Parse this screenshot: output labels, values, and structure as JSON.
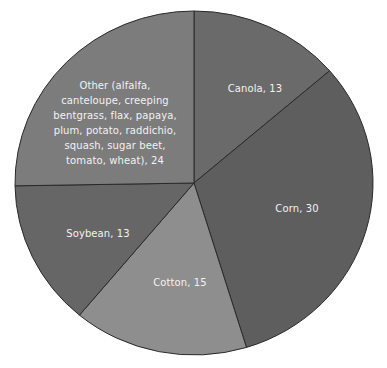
{
  "chart_data": {
    "type": "pie",
    "title": "",
    "xlabel": "",
    "ylabel": "",
    "legend": "none (data labels on slices)",
    "start_angle_deg": 0,
    "direction": "clockwise",
    "center": [
      194,
      183
    ],
    "radius": [
      179,
      172
    ],
    "categories": [
      "Canola",
      "Corn",
      "Cotton",
      "Soybean",
      "Other (alfalfa, canteloupe, creeping bentgrass, flax, papaya, plum, potato, raddichio, squash, sugar beet, tomato, wheat)"
    ],
    "values": [
      13,
      30,
      15,
      13,
      24
    ],
    "colors": [
      "#6a6a6a",
      "#5e5e5e",
      "#8e8e8e",
      "#666666",
      "#7c7c7c"
    ],
    "labels": [
      {
        "text": "Canola, 13",
        "x": 255,
        "y": 88
      },
      {
        "text": "Corn, 30",
        "x": 297,
        "y": 208
      },
      {
        "text": "Cotton, 15",
        "x": 180,
        "y": 282
      },
      {
        "text": "Soybean, 13",
        "x": 98,
        "y": 233
      },
      {
        "text": "Other (alfalfa,\ncanteloupe, creeping\nbentgrass, flax, papaya,\nplum, potato, raddichio,\nsquash, sugar beet,\ntomato, wheat), 24",
        "x": 115,
        "y": 123
      }
    ]
  },
  "style": {
    "border_color": "#2a2a2a",
    "label_color": "#f2f2f2",
    "background": "#ffffff"
  }
}
